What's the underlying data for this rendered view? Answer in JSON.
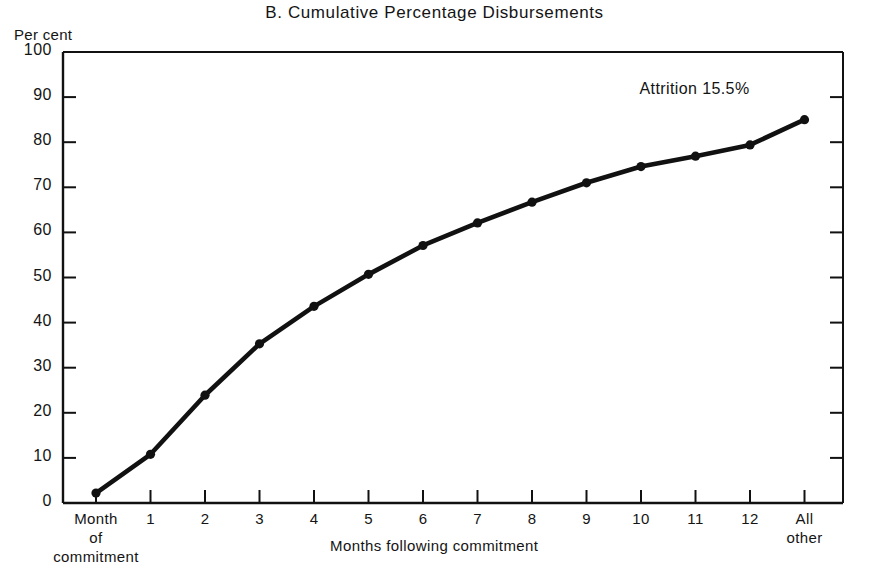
{
  "chart_data": {
    "type": "line",
    "title": "B.  Cumulative Percentage Disbursements",
    "xlabel": "Months following commitment",
    "ylabel": "Per cent",
    "ylim": [
      0,
      100
    ],
    "ytick_step": 10,
    "yticks": [
      0,
      10,
      20,
      30,
      40,
      50,
      60,
      70,
      80,
      90,
      100
    ],
    "ytick_labels": [
      "0",
      "10",
      "20",
      "30",
      "40",
      "50",
      "60",
      "70",
      "80",
      "90",
      "100"
    ],
    "categories": [
      "Month of commitment",
      "1",
      "2",
      "3",
      "4",
      "5",
      "6",
      "7",
      "8",
      "9",
      "10",
      "11",
      "12",
      "All other"
    ],
    "xtick_labels": [
      {
        "line1": "Month",
        "line2": "of",
        "line3": "commitment"
      },
      {
        "line1": "1"
      },
      {
        "line1": "2"
      },
      {
        "line1": "3"
      },
      {
        "line1": "4"
      },
      {
        "line1": "5"
      },
      {
        "line1": "6"
      },
      {
        "line1": "7"
      },
      {
        "line1": "8"
      },
      {
        "line1": "9"
      },
      {
        "line1": "10"
      },
      {
        "line1": "11"
      },
      {
        "line1": "12"
      },
      {
        "line1": "All",
        "line2": "other"
      }
    ],
    "values": [
      2.2,
      10.8,
      23.9,
      35.3,
      43.6,
      50.7,
      57.1,
      62.1,
      66.7,
      71.0,
      74.6,
      76.9,
      79.4,
      85.0
    ],
    "series": [
      {
        "name": "Cumulative percentage disbursements",
        "values": [
          2.2,
          10.8,
          23.9,
          35.3,
          43.6,
          50.7,
          57.1,
          62.1,
          66.7,
          71.0,
          74.6,
          76.9,
          79.4,
          85.0
        ]
      }
    ],
    "annotations": [
      {
        "text": "Attrition 15.5%",
        "at_category": "All other",
        "position": "above-last-point"
      }
    ],
    "grid": false,
    "legend": "none",
    "marker": "filled-circle",
    "line_color": "#111111",
    "axis_color": "#111111"
  }
}
